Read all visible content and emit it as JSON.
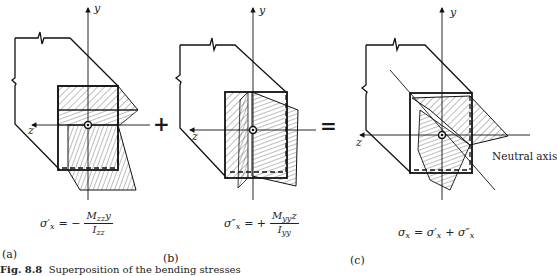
{
  "figure": {
    "caption_label": "Fig. 8.8",
    "caption_text": "Superposition of the bending stresses",
    "operators": {
      "plus": "+",
      "equals": "="
    },
    "panels": [
      {
        "id": "a",
        "label": "(a)",
        "axis_y": "y",
        "axis_z": "z",
        "equation": {
          "lhs": "σ′",
          "lhs_sub": "x",
          "sign": "= −",
          "numerator": "M",
          "num_sub": "zz",
          "num_var": "y",
          "denominator": "I",
          "den_sub": "zz"
        }
      },
      {
        "id": "b",
        "label": "(b)",
        "axis_y": "y",
        "axis_z": "z",
        "equation": {
          "lhs": "σ″",
          "lhs_sub": "x",
          "sign": "= +",
          "numerator": "M",
          "num_sub": "yy",
          "num_var": "z",
          "denominator": "I",
          "den_sub": "yy"
        }
      },
      {
        "id": "c",
        "label": "(c)",
        "axis_y": "y",
        "axis_z": "z",
        "annotation": "Neutral axis",
        "equation": {
          "lhs": "σ",
          "lhs_sub": "x",
          "rhs": "= σ′",
          "rhs_sub1": "x",
          "rhs_plus": "+ σ″",
          "rhs_sub2": "x"
        }
      }
    ]
  }
}
